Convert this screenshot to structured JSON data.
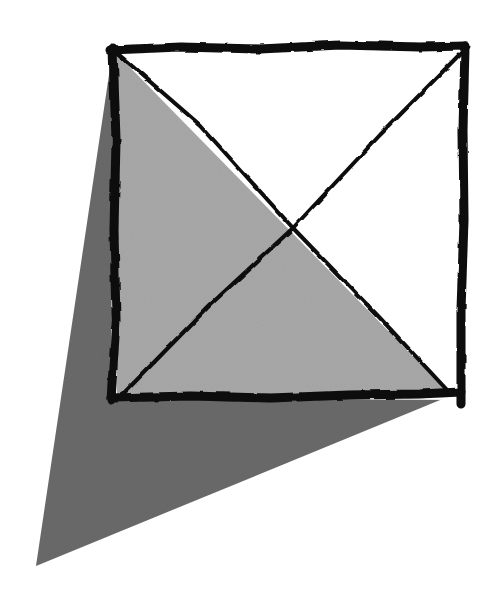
{
  "diagram": {
    "colors": {
      "background": "#ffffff",
      "stroke": "#0a0a0a",
      "inner_fill": "#a9a9a9",
      "shadow_fill": "#6b6b6b"
    },
    "square": {
      "top_left": [
        113,
        48
      ],
      "top_right": [
        465,
        48
      ],
      "bottom_right": [
        461,
        400
      ],
      "bottom_left": [
        111,
        398
      ]
    },
    "shadow_triangle": {
      "points": [
        [
          113,
          48
        ],
        [
          36,
          566
        ],
        [
          445,
          398
        ]
      ]
    },
    "inner_triangle": {
      "points": [
        [
          113,
          52
        ],
        [
          117,
          394
        ],
        [
          445,
          390
        ]
      ]
    },
    "diagonals": [
      {
        "from": [
          117,
          52
        ],
        "to": [
          448,
          392
        ]
      },
      {
        "from": [
          462,
          52
        ],
        "to": [
          122,
          394
        ]
      }
    ],
    "intersection": [
      293,
      228
    ]
  }
}
